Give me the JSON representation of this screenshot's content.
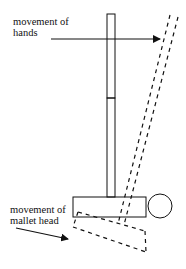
{
  "diagram": {
    "labels": {
      "hands": {
        "line1": "movement of",
        "line2": "hands"
      },
      "mallet_head": {
        "line1": "movement of",
        "line2": "mallet head"
      }
    },
    "colors": {
      "stroke": "#111111",
      "background": "#ffffff"
    },
    "elements": [
      "upright-mallet-shaft",
      "upright-mallet-head",
      "tilted-dashed-mallet-shaft",
      "tilted-dashed-mallet-head",
      "ball",
      "hands-arrow",
      "mallet-head-arrow"
    ]
  }
}
